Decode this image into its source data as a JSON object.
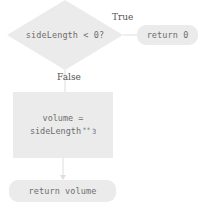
{
  "diagram": {
    "type": "flowchart",
    "colors": {
      "shape_fill": "#ebebeb",
      "code_text": "#6d6d6d",
      "label_text": "#555555",
      "connector": "#d8d8d8",
      "background": "#ffffff"
    },
    "nodes": {
      "decision": {
        "shape": "diamond",
        "text": "sideLength < 0?"
      },
      "return_zero": {
        "shape": "rounded-rectangle",
        "text": "return 0"
      },
      "process_volume": {
        "shape": "rectangle",
        "line1": "volume =",
        "line2_operand": "sideLength",
        "line2_operator": "**",
        "line2_exponent": "3"
      },
      "return_volume": {
        "shape": "rounded-rectangle",
        "text": "return volume"
      }
    },
    "edges": {
      "true_label": "True",
      "false_label": "False"
    }
  }
}
